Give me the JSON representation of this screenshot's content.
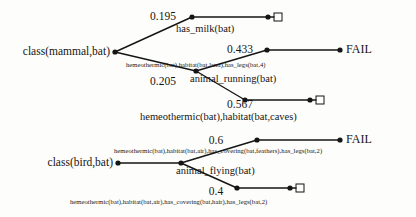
{
  "diagram": {
    "type": "proof-tree",
    "width": 416,
    "height": 217,
    "background": "#fdfdfb",
    "ink": "#151515",
    "roots": [
      {
        "id": "mammal",
        "label": "class(mammal,bat)",
        "x": 115,
        "y": 52
      },
      {
        "id": "bird",
        "label": "class(bird,bat)",
        "x": 118,
        "y": 163
      }
    ],
    "probabilities": [
      {
        "id": "p1",
        "value": "0.195",
        "x": 163,
        "y": 17
      },
      {
        "id": "p2",
        "value": "0.205",
        "x": 163,
        "y": 82
      },
      {
        "id": "p3",
        "value": "0.433",
        "x": 240,
        "y": 50
      },
      {
        "id": "p4",
        "value": "0.567",
        "x": 240,
        "y": 105
      },
      {
        "id": "p5",
        "value": "0.6",
        "x": 216,
        "y": 141
      },
      {
        "id": "p6",
        "value": "0.4",
        "x": 216,
        "y": 192
      }
    ],
    "node_labels": [
      {
        "id": "n1",
        "text": "has_milk(bat)",
        "x": 192,
        "y": 29
      },
      {
        "id": "n2",
        "text": "animal_running(bat)",
        "x": 196,
        "y": 79
      },
      {
        "id": "n3",
        "text": "hemeothermic(bat),habitat(bat,caves)",
        "x": 200,
        "y": 117
      },
      {
        "id": "n4",
        "text": "animal_flying(bat)",
        "x": 181,
        "y": 171
      }
    ],
    "clause_labels": [
      {
        "id": "c1",
        "text": "hemeothermic(bat),habitat(bat,land),has_legs(bat,4)",
        "x": 188,
        "y": 66
      },
      {
        "id": "c2",
        "text": "hemeothermic(bat),habitat(bat,air),has_covering(bat,feathers),has_legs(bat,2)",
        "x": 114,
        "y": 152
      },
      {
        "id": "c3",
        "text": "hemeothermic(bat),habitat(bat,air),has_covering(bat,hair),has_legs(bat,2)",
        "x": 70,
        "y": 203
      }
    ],
    "terminals": [
      {
        "id": "t1",
        "kind": "square",
        "x": 278,
        "y": 17
      },
      {
        "id": "t2",
        "kind": "fail",
        "label": "FAIL",
        "x": 348,
        "y": 50
      },
      {
        "id": "t3",
        "kind": "square",
        "x": 320,
        "y": 100
      },
      {
        "id": "t4",
        "kind": "fail",
        "label": "FAIL",
        "x": 348,
        "y": 140
      },
      {
        "id": "t5",
        "kind": "square",
        "x": 300,
        "y": 188
      }
    ],
    "dots": [
      {
        "id": "d-mammal",
        "x": 115,
        "y": 52
      },
      {
        "id": "d-bird",
        "x": 118,
        "y": 163
      },
      {
        "id": "d-n1",
        "x": 192,
        "y": 17
      },
      {
        "id": "d-n1-end",
        "x": 268,
        "y": 17
      },
      {
        "id": "d-n2",
        "x": 196,
        "y": 71
      },
      {
        "id": "d-n3",
        "x": 267,
        "y": 50
      },
      {
        "id": "d-n3-end",
        "x": 340,
        "y": 50
      },
      {
        "id": "d-n4",
        "x": 245,
        "y": 100
      },
      {
        "id": "d-n4-end",
        "x": 310,
        "y": 100
      },
      {
        "id": "d-n5",
        "x": 181,
        "y": 163
      },
      {
        "id": "d-n6",
        "x": 257,
        "y": 140
      },
      {
        "id": "d-n6-end",
        "x": 340,
        "y": 140
      },
      {
        "id": "d-n7",
        "x": 237,
        "y": 188
      },
      {
        "id": "d-n7-end",
        "x": 290,
        "y": 188
      }
    ],
    "edges": [
      {
        "id": "e1",
        "x1": 115,
        "y1": 52,
        "x2": 192,
        "y2": 17
      },
      {
        "id": "e2",
        "x1": 192,
        "y1": 17,
        "x2": 268,
        "y2": 17
      },
      {
        "id": "e3",
        "x1": 268,
        "y1": 17,
        "x2": 274,
        "y2": 17
      },
      {
        "id": "e4",
        "x1": 115,
        "y1": 52,
        "x2": 196,
        "y2": 71
      },
      {
        "id": "e5",
        "x1": 196,
        "y1": 71,
        "x2": 267,
        "y2": 50
      },
      {
        "id": "e6",
        "x1": 267,
        "y1": 50,
        "x2": 340,
        "y2": 50
      },
      {
        "id": "e7",
        "x1": 196,
        "y1": 71,
        "x2": 245,
        "y2": 100
      },
      {
        "id": "e8",
        "x1": 245,
        "y1": 100,
        "x2": 310,
        "y2": 100
      },
      {
        "id": "e9",
        "x1": 310,
        "y1": 100,
        "x2": 316,
        "y2": 100
      },
      {
        "id": "e10",
        "x1": 118,
        "y1": 163,
        "x2": 181,
        "y2": 163
      },
      {
        "id": "e11",
        "x1": 181,
        "y1": 163,
        "x2": 257,
        "y2": 140
      },
      {
        "id": "e12",
        "x1": 257,
        "y1": 140,
        "x2": 340,
        "y2": 140
      },
      {
        "id": "e13",
        "x1": 181,
        "y1": 163,
        "x2": 237,
        "y2": 188
      },
      {
        "id": "e14",
        "x1": 237,
        "y1": 188,
        "x2": 290,
        "y2": 188
      },
      {
        "id": "e15",
        "x1": 290,
        "y1": 188,
        "x2": 296,
        "y2": 188
      }
    ]
  }
}
